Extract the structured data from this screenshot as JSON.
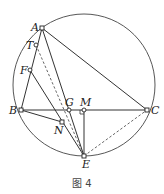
{
  "figure": {
    "caption": "图 4",
    "circle": {
      "cx": 84,
      "cy": 85,
      "r": 71
    },
    "points": {
      "A": {
        "label": "A",
        "x": 42,
        "y": 28
      },
      "T": {
        "label": "T",
        "x": 36,
        "y": 45
      },
      "F": {
        "label": "F",
        "x": 30,
        "y": 70
      },
      "B": {
        "label": "B",
        "x": 21,
        "y": 110
      },
      "G": {
        "label": "G",
        "x": 69,
        "y": 110
      },
      "M": {
        "label": "M",
        "x": 84,
        "y": 110
      },
      "C": {
        "label": "C",
        "x": 147,
        "y": 110
      },
      "N": {
        "label": "N",
        "x": 62,
        "y": 122
      },
      "E": {
        "label": "E",
        "x": 84,
        "y": 156
      }
    },
    "solid_segments": [
      "AB",
      "AC",
      "BC",
      "AE",
      "FE",
      "BN",
      "ME"
    ],
    "dashed_segments": [
      "TE",
      "EC"
    ],
    "right_angle_at": "M",
    "colors": {
      "stroke": "#333333",
      "point_fill": "#ffffff"
    }
  }
}
